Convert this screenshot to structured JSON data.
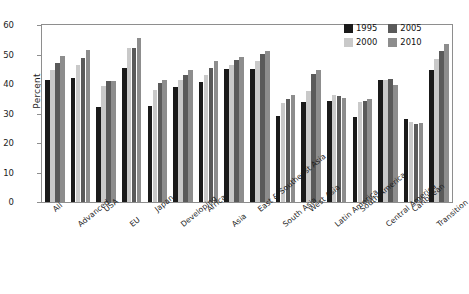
{
  "chart_data": {
    "type": "bar",
    "title": "",
    "xlabel": "",
    "ylabel": "Percent",
    "ylim": [
      0,
      60
    ],
    "yticks": [
      0,
      10,
      20,
      30,
      40,
      50,
      60
    ],
    "grid": false,
    "legend_position": "top-right",
    "categories": [
      "All",
      "Advanced",
      "USA",
      "EU",
      "Japan",
      "Developing",
      "Africa",
      "Asia",
      "East & Southeast Asia",
      "South Asia",
      "West Asia",
      "Latin America",
      "South America",
      "Central America",
      "Caribbean",
      "Transition"
    ],
    "series": [
      {
        "name": "1995",
        "color": "#1a1a1a",
        "values": [
          41.2,
          42.0,
          32.1,
          45.3,
          32.4,
          38.9,
          40.8,
          45.0,
          45.0,
          29.0,
          34.0,
          34.2,
          28.8,
          41.3,
          28.0,
          44.6
        ]
      },
      {
        "name": "2000",
        "color": "#c9c9c9",
        "values": [
          44.8,
          46.3,
          39.4,
          52.1,
          38.0,
          41.2,
          43.2,
          46.6,
          47.9,
          33.4,
          37.5,
          36.2,
          33.8,
          41.5,
          27.2,
          48.6
        ]
      },
      {
        "name": "2005",
        "color": "#5a5a5a",
        "values": [
          47.2,
          48.9,
          41.0,
          52.2,
          40.5,
          43.0,
          45.3,
          48.0,
          50.2,
          35.0,
          43.3,
          35.8,
          34.4,
          41.6,
          26.6,
          51.3
        ]
      },
      {
        "name": "2010",
        "color": "#8d8d8d",
        "values": [
          49.5,
          51.6,
          41.1,
          55.6,
          41.4,
          44.9,
          47.8,
          49.0,
          51.2,
          36.2,
          44.9,
          35.2,
          34.9,
          39.8,
          26.7,
          53.4
        ]
      }
    ]
  },
  "legend": {
    "entries": [
      {
        "label": "1995",
        "color": "#1a1a1a"
      },
      {
        "label": "2005",
        "color": "#5a5a5a"
      },
      {
        "label": "2000",
        "color": "#c9c9c9"
      },
      {
        "label": "2010",
        "color": "#8d8d8d"
      }
    ]
  }
}
